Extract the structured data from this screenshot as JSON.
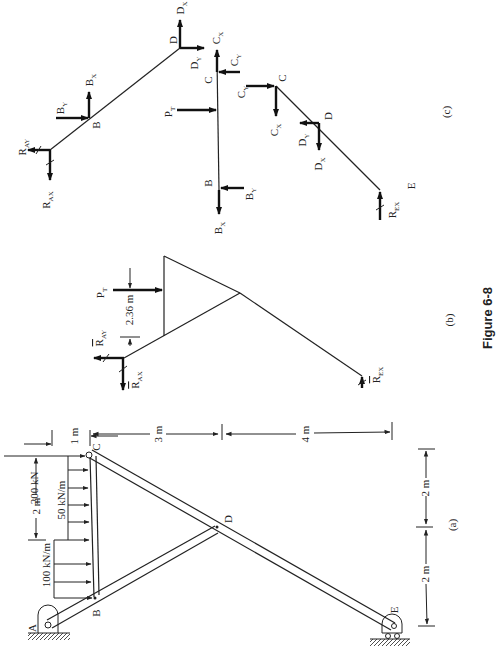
{
  "figure": {
    "caption": "Figure 6-8",
    "orientation": "rotated 90 degrees counter-clockwise",
    "panels": {
      "a": {
        "label": "(a)",
        "joints": [
          "A",
          "B",
          "C",
          "D",
          "E"
        ],
        "loads": {
          "point_load": "200 kN",
          "distributed_1": "50 kN/m",
          "distributed_2": "100 kN/m"
        },
        "dimensions": {
          "top_1": "1 m",
          "top_2": "2 m",
          "vert_1": "3 m",
          "vert_2": "4 m",
          "bottom_1": "2 m",
          "bottom_2": "2 m"
        }
      },
      "b": {
        "label": "(b)",
        "forces": {
          "pt": "P",
          "pt_sub": "T",
          "ray": "R",
          "ray_sub": "AY",
          "rax": "R",
          "rax_sub": "AX",
          "rex": "R",
          "rex_sub": "EX"
        },
        "dimension": "2.36 m"
      },
      "c": {
        "label": "(c)",
        "joints": {
          "b1": "B",
          "d1": "D",
          "c2": "C",
          "b2": "B",
          "c3": "C",
          "d3": "D",
          "e3": "E"
        },
        "forces": {
          "R": "R",
          "AY": "AY",
          "AX": "AX",
          "EX": "EX",
          "B": "B",
          "C": "C",
          "D": "D",
          "P": "P",
          "X": "X",
          "Y": "Y",
          "T": "T"
        }
      }
    }
  }
}
